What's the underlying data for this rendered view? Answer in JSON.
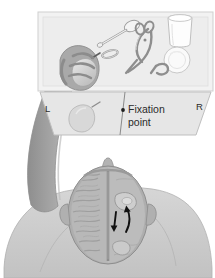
{
  "figure": {
    "panels": {
      "table_scene": {
        "name": "table-with-objects-panel",
        "background_color": "#f2f2f2",
        "border_color": "#cfcfcf",
        "objects": [
          {
            "name": "spoon",
            "label": "spoon"
          },
          {
            "name": "scissors",
            "label": "scissors"
          },
          {
            "name": "cup",
            "label": "cup"
          },
          {
            "name": "plate",
            "label": "plate"
          },
          {
            "name": "ring",
            "label": "ring"
          },
          {
            "name": "hook",
            "label": "hook"
          },
          {
            "name": "pear-in-hand",
            "label": "pear"
          }
        ]
      },
      "visual_field": {
        "name": "visual-field-panel",
        "background_color": "#e6e6e6",
        "left_label": "L",
        "right_label": "R",
        "fixation_label_line1": "Fixation",
        "fixation_label_line2": "point",
        "stimulus": "pear"
      },
      "brain": {
        "name": "brain-top-view",
        "skull_color": "#9a9a9a",
        "cortex_color": "#b5b5b5",
        "body_color": "#cfcfcf",
        "arrow_color": "#111111",
        "hemispheres": [
          "left-hemisphere",
          "right-hemisphere"
        ],
        "arrows": [
          {
            "name": "arrow-down",
            "direction": "down"
          },
          {
            "name": "arrow-up-curved",
            "direction": "up"
          }
        ]
      }
    }
  }
}
